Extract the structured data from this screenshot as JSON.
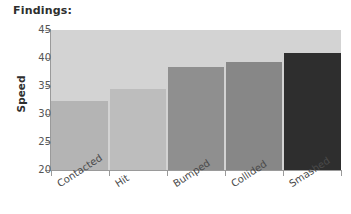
{
  "chart_data": {
    "type": "bar",
    "title": "Findings:",
    "xlabel": "",
    "ylabel": "Speed",
    "categories": [
      "Contacted",
      "Hit",
      "Bumped",
      "Collided",
      "Smashed"
    ],
    "values": [
      32.3,
      34.5,
      38.4,
      39.3,
      40.9
    ],
    "ylim": [
      20,
      45
    ],
    "yticks": [
      20,
      25,
      30,
      35,
      40,
      45
    ],
    "ytick_labels": [
      "20",
      "25",
      "30",
      "35",
      "40",
      "45"
    ],
    "grid": false,
    "legend": null,
    "bar_colors": [
      "#b4b4b4",
      "#bdbdbd",
      "#8f8f8f",
      "#878787",
      "#2e2e2e"
    ],
    "plot_background": "#d3d3d3",
    "axis_color": "#9a9a9a",
    "title_color": "#2e2e2e",
    "tick_label_color": "#555555"
  }
}
